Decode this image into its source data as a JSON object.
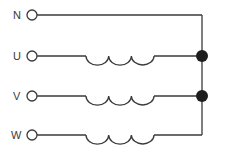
{
  "diagram": {
    "type": "three-phase star (wye) winding with neutral",
    "colors": {
      "line": "#3a3a3a",
      "node": "#1e1e1e",
      "background": "#ffffff"
    },
    "terminals": [
      {
        "label": "N",
        "y": 15,
        "has_coil": false
      },
      {
        "label": "U",
        "y": 56,
        "has_coil": true
      },
      {
        "label": "V",
        "y": 96,
        "has_coil": true
      },
      {
        "label": "W",
        "y": 135,
        "has_coil": true
      }
    ],
    "coil": {
      "x_start": 86,
      "x_end": 154,
      "turns": 3
    },
    "bus": {
      "x": 202,
      "y_top": 15,
      "y_bottom": 135
    },
    "junction_nodes": [
      {
        "y": 56
      },
      {
        "y": 96
      }
    ]
  }
}
